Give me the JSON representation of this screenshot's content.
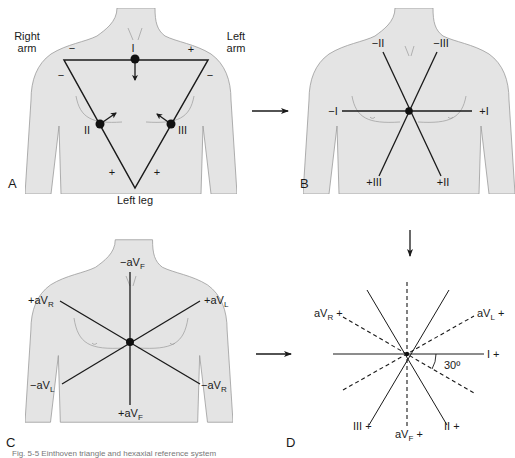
{
  "figure": {
    "panels": {
      "A": {
        "letter": "A",
        "title": "Einthoven triangle",
        "limb_labels": {
          "right_arm": [
            "Right",
            "arm"
          ],
          "left_arm": [
            "Left",
            "arm"
          ],
          "left_leg": "Left leg"
        },
        "polarity": {
          "ra_top": "−",
          "ra_side": "−",
          "la_top": "+",
          "la_side": "−",
          "ll_left": "+",
          "ll_right": "+"
        },
        "leads": {
          "lead1": "I",
          "lead2": "II",
          "lead3": "III"
        }
      },
      "B": {
        "letter": "B",
        "labels": {
          "neg2": "−II",
          "neg3": "−III",
          "neg1": "−I",
          "pos1": "+I",
          "pos3": "+III",
          "pos2": "+II"
        }
      },
      "C": {
        "letter": "C",
        "labels": {
          "neg_avf": [
            "−aV",
            "F"
          ],
          "pos_avr": [
            "+aV",
            "R"
          ],
          "pos_avl": [
            "+aV",
            "L"
          ],
          "neg_avl": [
            "−aV",
            "L"
          ],
          "neg_avr": [
            "−aV",
            "R"
          ],
          "pos_avf": [
            "+aV",
            "F"
          ]
        }
      },
      "D": {
        "letter": "D",
        "labels": {
          "avr": [
            "aV",
            "R",
            " +"
          ],
          "avl": [
            "aV",
            "L",
            " +"
          ],
          "lead1": "I +",
          "lead3": "III +",
          "avf": [
            "aV",
            "F",
            " +"
          ],
          "lead2": "II +"
        },
        "angle_label": "30º"
      }
    },
    "caption": "Fig. 5-5 Einthoven triangle and hexaxial reference system"
  },
  "colors": {
    "torso_fill": "#e4e4e4",
    "torso_stroke": "#9a9a9a",
    "line": "#1a1a1a",
    "background": "#ffffff"
  }
}
